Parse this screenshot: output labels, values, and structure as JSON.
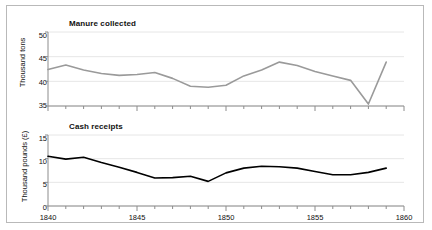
{
  "chart_data": [
    {
      "type": "line",
      "title": "Manure collected",
      "xlabel": "",
      "ylabel": "Thousand tons",
      "xlim": [
        1840,
        1860
      ],
      "ylim": [
        35,
        50
      ],
      "yticks": [
        35,
        40,
        45,
        50
      ],
      "xticks": [
        1840,
        1845,
        1850,
        1855,
        1860
      ],
      "xticklabels": [
        "1840",
        "1845",
        "1850",
        "1855",
        "1860"
      ],
      "yticklabels": [
        "35",
        "40",
        "45",
        "50"
      ],
      "grid": true,
      "legend": "none",
      "line_color": "#9a9a9a",
      "x": [
        1840,
        1841,
        1842,
        1843,
        1844,
        1845,
        1846,
        1847,
        1848,
        1849,
        1850,
        1851,
        1852,
        1853,
        1854,
        1855,
        1856,
        1857,
        1858,
        1859
      ],
      "values": [
        42.4,
        43.3,
        42.3,
        41.6,
        41.2,
        41.4,
        41.8,
        40.6,
        39.0,
        38.8,
        39.2,
        41.1,
        42.3,
        43.9,
        43.2,
        42.0,
        41.1,
        40.2,
        35.4,
        43.9
      ],
      "series": [
        {
          "name": "Manure collected",
          "values": [
            42.4,
            43.3,
            42.3,
            41.6,
            41.2,
            41.4,
            41.8,
            40.6,
            39.0,
            38.8,
            39.2,
            41.1,
            42.3,
            43.9,
            43.2,
            42.0,
            41.1,
            40.2,
            35.4,
            43.9
          ]
        }
      ]
    },
    {
      "type": "line",
      "title": "Cash receipts",
      "xlabel": "",
      "ylabel": "Thousand  pounds (£)",
      "xlim": [
        1840,
        1860
      ],
      "ylim": [
        0,
        15
      ],
      "yticks": [
        0,
        5,
        10,
        15
      ],
      "xticks": [
        1840,
        1845,
        1850,
        1855,
        1860
      ],
      "xticklabels": [
        "1840",
        "1845",
        "1850",
        "1855",
        "1860"
      ],
      "yticklabels": [
        "0",
        "5",
        "10",
        "15"
      ],
      "grid": true,
      "legend": "none",
      "line_color": "#000000",
      "x": [
        1840,
        1841,
        1842,
        1843,
        1844,
        1845,
        1846,
        1847,
        1848,
        1849,
        1850,
        1851,
        1852,
        1853,
        1854,
        1855,
        1856,
        1857,
        1858,
        1859
      ],
      "values": [
        10.5,
        9.9,
        10.3,
        9.2,
        8.2,
        7.1,
        5.9,
        6.0,
        6.3,
        5.2,
        7.0,
        8.0,
        8.4,
        8.3,
        8.0,
        7.3,
        6.6,
        6.6,
        7.1,
        8.0
      ],
      "series": [
        {
          "name": "Cash receipts",
          "values": [
            10.5,
            9.9,
            10.3,
            9.2,
            8.2,
            7.1,
            5.9,
            6.0,
            6.3,
            5.2,
            7.0,
            8.0,
            8.4,
            8.3,
            8.0,
            7.3,
            6.6,
            6.6,
            7.1,
            8.0
          ]
        }
      ]
    }
  ],
  "colors": {
    "frame_border": "#b9b9b9",
    "axis": "#8c8c8c",
    "grid": "#e6e6e6",
    "top_line": "#9a9a9a",
    "bottom_line": "#000000",
    "text": "#111111",
    "background": "#ffffff"
  }
}
